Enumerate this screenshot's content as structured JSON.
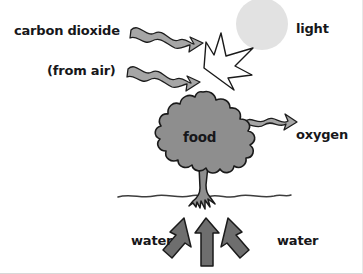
{
  "diagram": {
    "background_color": "#ffffff",
    "labels": {
      "carbon_dioxide": "carbon dioxide",
      "from_air": "(from air)",
      "light": "light",
      "food": "food",
      "oxygen": "oxygen",
      "water_left": "water",
      "water_right": "water"
    },
    "colors": {
      "text": "#17171a",
      "sun_fill": "#e2e2e2",
      "tree_fill": "#8e8e8e",
      "trunk_fill": "#8e8e8e",
      "arrow_fill": "#9a9a9a",
      "water_arrow_fill": "#6e6e6e",
      "light_arrow_fill": "#ffffff",
      "outline": "#1a1a1a",
      "ground_line": "#4a4a4a"
    },
    "elements": {
      "sun": "sun-circle",
      "light_arrow": "light-ray-arrow",
      "co2_arrow_1": "wavy-arrow-carbon-dioxide",
      "co2_arrow_2": "wavy-arrow-from-air",
      "oxygen_arrow": "wavy-arrow-oxygen",
      "tree": "tree-canopy",
      "trunk": "tree-trunk",
      "ground": "ground-line",
      "water_arrow_left": "water-arrow-left",
      "water_arrow_center": "water-arrow-center",
      "water_arrow_right": "water-arrow-right"
    }
  }
}
